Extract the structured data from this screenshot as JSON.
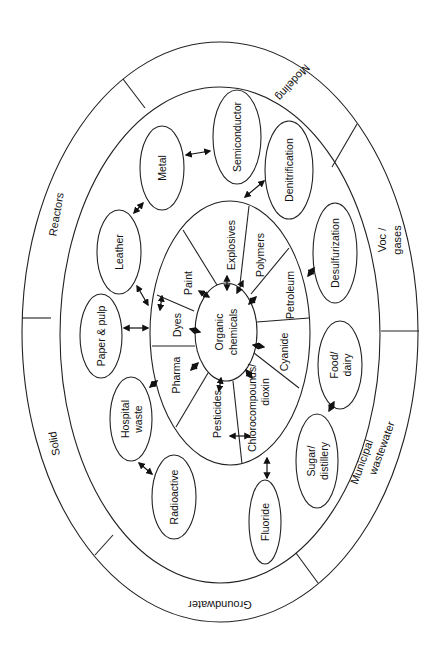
{
  "diagram": {
    "colors": {
      "line": "#222222",
      "text": "#111111",
      "background": "#ffffff"
    },
    "outer_ring": {
      "segments": [
        {
          "label": "Modeling"
        },
        {
          "label": "Reactors"
        },
        {
          "label": "Solid"
        },
        {
          "label": "Groundwater"
        },
        {
          "label": "Municipal wastewater",
          "lines": [
            "Municipal",
            "wastewater"
          ]
        },
        {
          "label": "Voc / gases",
          "lines": [
            "Voc /",
            "gases"
          ]
        }
      ]
    },
    "waste_types": [
      {
        "label": "Metal",
        "lines": [
          "Metal"
        ]
      },
      {
        "label": "Semiconductor",
        "lines": [
          "Semiconductor"
        ]
      },
      {
        "label": "Denitrification",
        "lines": [
          "Denitrification"
        ]
      },
      {
        "label": "Desulfurization",
        "lines": [
          "Desulfurization"
        ]
      },
      {
        "label": "Food/dairy",
        "lines": [
          "Food/",
          "dairy"
        ]
      },
      {
        "label": "Sugar/distillery",
        "lines": [
          "Sugar/",
          "distillery"
        ]
      },
      {
        "label": "Fluoride",
        "lines": [
          "Fluoride"
        ]
      },
      {
        "label": "Radioactive",
        "lines": [
          "Radioactive"
        ]
      },
      {
        "label": "Hospital waste",
        "lines": [
          "Hospital",
          "waste"
        ]
      },
      {
        "label": "Paper & pulp",
        "lines": [
          "Paper & pulp"
        ]
      },
      {
        "label": "Leather",
        "lines": [
          "Leather"
        ]
      }
    ],
    "sectors": [
      {
        "label": "Explosives",
        "lines": [
          "Explosives"
        ]
      },
      {
        "label": "Polymers",
        "lines": [
          "Polymers"
        ]
      },
      {
        "label": "Petroleum",
        "lines": [
          "Petroleum"
        ]
      },
      {
        "label": "Cyanide",
        "lines": [
          "Cyanide"
        ]
      },
      {
        "label": "Chlorocompounds/dioxin",
        "lines": [
          "Chlorocompounds/",
          "dioxin"
        ]
      },
      {
        "label": "Pesticides",
        "lines": [
          "Pesticides"
        ]
      },
      {
        "label": "Pharma",
        "lines": [
          "Pharma"
        ]
      },
      {
        "label": "Dyes",
        "lines": [
          "Dyes"
        ]
      },
      {
        "label": "Paint",
        "lines": [
          "Paint"
        ]
      }
    ],
    "center": {
      "label": "Organic chemicals",
      "lines": [
        "Organic",
        "chemicals"
      ]
    }
  }
}
